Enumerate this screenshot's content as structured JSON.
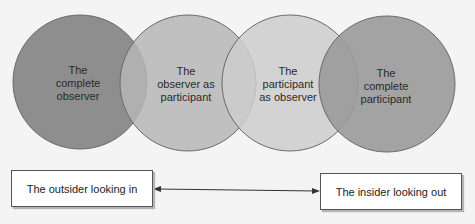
{
  "circles": [
    {
      "label_line1": "The",
      "label_line2": "complete",
      "label_line3": "observer",
      "color": "#8e8e8e"
    },
    {
      "label_line1": "The",
      "label_line2": "observer as",
      "label_line3": "participant",
      "color": "#b6b6b6"
    },
    {
      "label_line1": "The",
      "label_line2": "participant",
      "label_line3": "as observer",
      "color": "#cdcdcd"
    },
    {
      "label_line1": "The",
      "label_line2": "complete",
      "label_line3": "participant",
      "color": "#9a9a9a"
    }
  ],
  "continuum": {
    "left_label": "The outsider looking in",
    "right_label": "The insider looking out",
    "arrow": "double-headed"
  }
}
